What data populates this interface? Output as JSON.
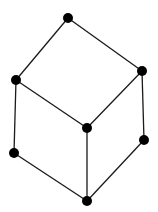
{
  "diagram": {
    "type": "hasse-diagram",
    "colors": {
      "node": "#000000",
      "edge": "#1a1a1a",
      "background": "#ffffff"
    },
    "node_radius": 5,
    "nodes": [
      {
        "id": "top",
        "x": 68,
        "y": 18
      },
      {
        "id": "left-upper",
        "x": 16,
        "y": 80
      },
      {
        "id": "right-upper",
        "x": 142,
        "y": 71
      },
      {
        "id": "center",
        "x": 87,
        "y": 128
      },
      {
        "id": "left-lower",
        "x": 14,
        "y": 153
      },
      {
        "id": "right-lower",
        "x": 144,
        "y": 140
      },
      {
        "id": "bottom",
        "x": 87,
        "y": 201
      }
    ],
    "edges": [
      [
        "top",
        "left-upper"
      ],
      [
        "top",
        "right-upper"
      ],
      [
        "left-upper",
        "center"
      ],
      [
        "right-upper",
        "center"
      ],
      [
        "left-upper",
        "left-lower"
      ],
      [
        "right-upper",
        "right-lower"
      ],
      [
        "center",
        "bottom"
      ],
      [
        "left-lower",
        "bottom"
      ],
      [
        "right-lower",
        "bottom"
      ]
    ]
  }
}
